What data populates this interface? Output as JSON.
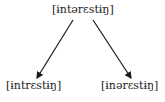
{
  "diagram": {
    "root": {
      "label": "[ɨntərɛstɨŋ]"
    },
    "children": [
      {
        "label": "[ɨntrɛstɨŋ]"
      },
      {
        "label": "[ɨnərɛstɨŋ]"
      }
    ],
    "edges": [
      {
        "from": "root",
        "to": "children.0",
        "type": "arrow"
      },
      {
        "from": "root",
        "to": "children.1",
        "type": "arrow"
      }
    ],
    "colors": {
      "text": "#1a1a1a",
      "arrow": "#1a1a1a",
      "background": "#ffffff"
    }
  }
}
